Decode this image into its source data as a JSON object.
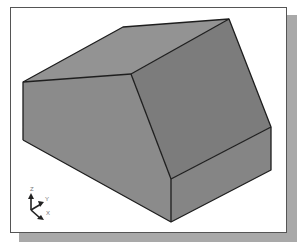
{
  "figure": {
    "type": "isometric-3d-solid",
    "colors": {
      "background": "#ffffff",
      "frame_border": "#555555",
      "frame_shadow": "#a9a9a9",
      "face_top_left": "#8f8f8f",
      "face_top_right": "#7b7b7b",
      "face_front_left": "#8a8a8a",
      "face_front_right": "#858585",
      "edge": "#1e1e1e"
    }
  },
  "axis_triad": {
    "labels": {
      "z": "Z",
      "y": "Y",
      "x": "X"
    }
  }
}
